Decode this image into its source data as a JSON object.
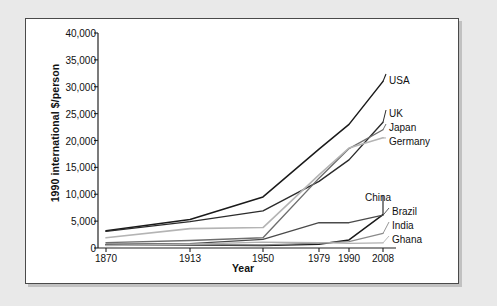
{
  "chart_data": {
    "type": "line",
    "title": "",
    "xlabel": "Year",
    "ylabel": "1990 international $/person",
    "x": [
      1870,
      1913,
      1950,
      1979,
      1990,
      2008
    ],
    "xtick_labels": [
      "1870",
      "1913",
      "1950",
      "1979",
      "1990",
      "2008"
    ],
    "ytick_labels": [
      "0",
      "5,000",
      "10,000",
      "15,000",
      "20,000",
      "25,000",
      "30,000",
      "35,000",
      "40,000"
    ],
    "ytick_values": [
      0,
      5000,
      10000,
      15000,
      20000,
      25000,
      30000,
      35000,
      40000
    ],
    "ylim": [
      0,
      40000
    ],
    "xlim": [
      1870,
      2008
    ],
    "grid": false,
    "legend_position": "right-inline-labels",
    "series": [
      {
        "name": "USA",
        "color": "#1a1a1a",
        "width": 1.5,
        "values": [
          3200,
          5300,
          9500,
          18400,
          23000,
          31000
        ]
      },
      {
        "name": "UK",
        "color": "#2b2b2b",
        "width": 1.4,
        "values": [
          3100,
          4900,
          6900,
          12400,
          16400,
          23400
        ]
      },
      {
        "name": "Japan",
        "color": "#6e6e6e",
        "width": 1.4,
        "values": [
          1000,
          1400,
          1900,
          13000,
          18500,
          22000
        ]
      },
      {
        "name": "Germany",
        "color": "#b4b4b4",
        "width": 1.6,
        "values": [
          1900,
          3600,
          3800,
          13600,
          18600,
          20500
        ]
      },
      {
        "name": "China",
        "color": "#1a1a1a",
        "width": 1.5,
        "values": [
          600,
          550,
          450,
          700,
          1500,
          6200
        ]
      },
      {
        "name": "Brazil",
        "color": "#4a4a4a",
        "width": 1.3,
        "values": [
          700,
          800,
          1600,
          4700,
          4700,
          6100
        ]
      },
      {
        "name": "India",
        "color": "#8a8a8a",
        "width": 1.3,
        "values": [
          550,
          650,
          600,
          900,
          1200,
          2700
        ]
      },
      {
        "name": "Ghana",
        "color": "#b0b0b0",
        "width": 1.3,
        "values": [
          450,
          700,
          1100,
          1000,
          850,
          950
        ]
      }
    ],
    "annotations": [
      {
        "text": "USA",
        "anchor_series": "USA"
      },
      {
        "text": "UK",
        "anchor_series": "UK"
      },
      {
        "text": "Japan",
        "anchor_series": "Japan"
      },
      {
        "text": "Germany",
        "anchor_series": "Germany"
      },
      {
        "text": "China",
        "anchor_series": "China"
      },
      {
        "text": "Brazil",
        "anchor_series": "Brazil"
      },
      {
        "text": "India",
        "anchor_series": "India"
      },
      {
        "text": "Ghana",
        "anchor_series": "Ghana"
      }
    ]
  },
  "labels": {
    "usa": "USA",
    "uk": "UK",
    "japan": "Japan",
    "germany": "Germany",
    "china": "China",
    "brazil": "Brazil",
    "india": "India",
    "ghana": "Ghana"
  },
  "axis": {
    "y_title": "1990 international $/person",
    "x_title": "Year",
    "y0": "0",
    "y1": "5,000",
    "y2": "10,000",
    "y3": "15,000",
    "y4": "20,000",
    "y5": "25,000",
    "y6": "30,000",
    "y7": "35,000",
    "y8": "40,000",
    "x0": "1870",
    "x1": "1913",
    "x2": "1950",
    "x3": "1979",
    "x4": "1990",
    "x5": "2008"
  }
}
